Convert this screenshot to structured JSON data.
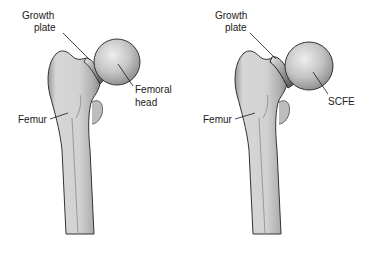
{
  "panels": [
    {
      "id": "normal",
      "labels": {
        "growth_plate_line1": "Growth",
        "growth_plate_line2": "plate",
        "head_line1": "Femoral",
        "head_line2": "head",
        "femur": "Femur"
      }
    },
    {
      "id": "scfe",
      "labels": {
        "growth_plate_line1": "Growth",
        "growth_plate_line2": "plate",
        "head_line1": "SCFE",
        "femur": "Femur"
      }
    }
  ]
}
